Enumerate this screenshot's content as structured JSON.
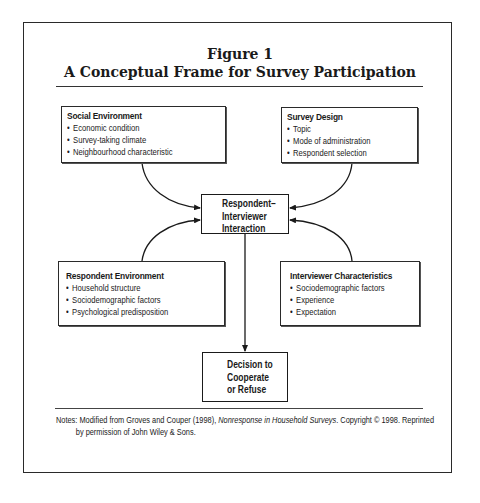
{
  "figure": {
    "number": "Figure 1",
    "title": "A Conceptual Frame for Survey Participation"
  },
  "boxes": {
    "social_environment": {
      "heading": "Social Environment",
      "items": [
        "Economic condition",
        "Survey-taking climate",
        "Neighbourhood characteristic"
      ]
    },
    "survey_design": {
      "heading": "Survey Design",
      "items": [
        "Topic",
        "Mode of administration",
        "Respondent selection"
      ]
    },
    "respondent_environment": {
      "heading": "Respondent Environment",
      "items": [
        "Household structure",
        "Sociodemographic factors",
        "Psychological predisposition"
      ]
    },
    "interviewer_characteristics": {
      "heading": "Interviewer Characteristics",
      "items": [
        "Sociodemographic factors",
        "Experience",
        "Expectation"
      ]
    },
    "interaction": {
      "lines": [
        "Respondent–",
        "Interviewer",
        "Interaction"
      ]
    },
    "decision": {
      "lines": [
        "Decision to",
        "Cooperate",
        "or Refuse"
      ]
    }
  },
  "notes": {
    "prefix": "Notes: Modified from Groves and Couper (1998), ",
    "book_title": "Nonresponse in Household Surveys",
    "suffix": ". Copyright © 1998. Reprinted",
    "line2": "by permission of John Wiley & Sons."
  }
}
